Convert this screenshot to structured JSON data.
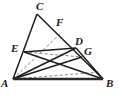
{
  "figure": {
    "name": "triangle-cevian-diagram",
    "width": 119,
    "height": 97,
    "background_color": "#ffffff",
    "stroke_color": "#1d1d1d",
    "dashed_stroke_color": "#6f6f6f",
    "base_stroke_color": "#2a2a2a"
  },
  "points": {
    "A": {
      "label": "A",
      "x": 13,
      "y": 79,
      "label_x": 2,
      "label_y": 78
    },
    "B": {
      "label": "B",
      "x": 103,
      "y": 79,
      "label_x": 106,
      "label_y": 78
    },
    "C": {
      "label": "C",
      "x": 37,
      "y": 14,
      "label_x": 36,
      "label_y": 1
    },
    "D": {
      "label": "D",
      "x": 76,
      "y": 48,
      "label_x": 76,
      "label_y": 37
    },
    "E": {
      "label": "E",
      "x": 24,
      "y": 52,
      "label_x": 11,
      "label_y": 44
    },
    "F": {
      "label": "F",
      "x": 62,
      "y": 32,
      "label_x": 56,
      "label_y": 18
    },
    "G": {
      "label": "G",
      "x": 82,
      "y": 57,
      "label_x": 84,
      "label_y": 47
    }
  },
  "segments": {
    "solid": [
      {
        "name": "segment-A-C",
        "from": "A",
        "to": "C"
      },
      {
        "name": "segment-C-B",
        "from": "C",
        "to": "B"
      },
      {
        "name": "segment-E-D",
        "from": "E",
        "to": "D"
      },
      {
        "name": "segment-E-B",
        "from": "E",
        "to": "B"
      },
      {
        "name": "segment-A-D",
        "from": "A",
        "to": "D"
      },
      {
        "name": "segment-A-G",
        "from": "A",
        "to": "G"
      },
      {
        "name": "segment-D-B",
        "from": "D",
        "to": "B"
      }
    ],
    "dashed": [
      {
        "name": "segment-A-F-dashed",
        "from": "A",
        "to": "F"
      },
      {
        "name": "segment-A-B-dashed-upper",
        "from": "A",
        "to": "G"
      },
      {
        "name": "segment-E-G-dashed",
        "from": "E",
        "to": "G"
      }
    ],
    "base": [
      {
        "name": "segment-A-B-base",
        "from": "A",
        "to": "B"
      }
    ]
  },
  "labels_order": [
    "C",
    "F",
    "E",
    "D",
    "G",
    "A",
    "B"
  ]
}
